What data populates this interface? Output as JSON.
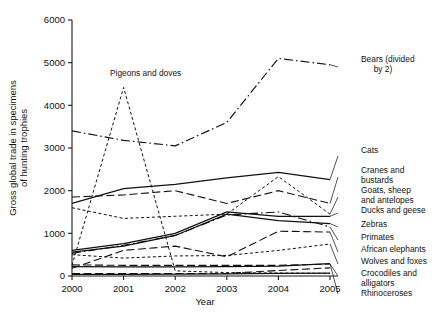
{
  "chart_data": {
    "type": "line",
    "title": "",
    "xlabel": "Year",
    "ylabel": "Gross global trade in specimens of hunting trophies",
    "x": [
      2000,
      2001,
      2002,
      2003,
      2004,
      2005
    ],
    "xticklabels": [
      "2000",
      "2001",
      "2002",
      "2003",
      "2004",
      "2005"
    ],
    "yticklabels": [
      "0",
      "1000",
      "2000",
      "3000",
      "4000",
      "5000",
      "6000"
    ],
    "yticks": [
      0,
      1000,
      2000,
      3000,
      4000,
      5000,
      6000
    ],
    "ylim": [
      0,
      6000
    ],
    "xlim": [
      2000,
      2005
    ],
    "grid": false,
    "legend_position": "right-of-axes-with-leader-lines",
    "series": [
      {
        "name": "Bears (divided by 2)",
        "label": "Bears (divided\nby 2)",
        "label_line1": "Bears (divided",
        "label_line2": "by 2)",
        "dash": "dashdot",
        "values": [
          3400,
          3180,
          3050,
          3600,
          5100,
          4950
        ]
      },
      {
        "name": "Pigeons and doves",
        "label": "Pigeons and doves",
        "dash": "dashed-fine",
        "values": [
          250,
          4420,
          120,
          80,
          70,
          60
        ]
      },
      {
        "name": "Cats",
        "label": "Cats",
        "dash": "solid",
        "values": [
          1700,
          2050,
          2150,
          2300,
          2430,
          2260
        ]
      },
      {
        "name": "Cranes and bustards",
        "label": "Cranes and\nbustards",
        "label_line1": "Cranes and",
        "label_line2": "bustards",
        "dash": "longdash",
        "values": [
          1850,
          1900,
          2000,
          1700,
          2000,
          1700
        ]
      },
      {
        "name": "Goats, sheep and antelopes",
        "label": "Goats, sheep\nand antelopes",
        "label_line1": "Goats, sheep",
        "label_line2": "and antelopes",
        "dash": "dashed-fine",
        "values": [
          1600,
          1350,
          1400,
          1450,
          2330,
          1450
        ]
      },
      {
        "name": "Ducks and geese",
        "label": "Ducks and geese",
        "dash": "solid",
        "values": [
          600,
          760,
          1000,
          1500,
          1400,
          1400
        ]
      },
      {
        "name": "Zebras",
        "label": "Zebras",
        "dash": "solid",
        "values": [
          560,
          700,
          950,
          1450,
          1300,
          1230
        ]
      },
      {
        "name": "Primates",
        "label": "Primates",
        "dash": "dashdot",
        "values": [
          530,
          720,
          950,
          1430,
          1500,
          1150
        ]
      },
      {
        "name": "African elephants",
        "label": "African elephants",
        "dash": "longdash",
        "values": [
          180,
          600,
          700,
          450,
          1050,
          1030
        ]
      },
      {
        "name": "Wolves and foxes",
        "label": "Wolves and foxes",
        "dash": "dashed-fine",
        "values": [
          500,
          420,
          470,
          480,
          600,
          750
        ]
      },
      {
        "name": "Crocodiles and alligators",
        "label": "Crocodiles and\nalligators",
        "label_line1": "Crocodiles and",
        "label_line2": "alligators",
        "dash": "longdash",
        "values": [
          260,
          250,
          250,
          250,
          250,
          280
        ]
      },
      {
        "name": "Rhinoceroses",
        "label": "Rhinoceroses",
        "dash": "solid",
        "values": [
          220,
          215,
          215,
          220,
          230,
          290
        ]
      },
      {
        "name": "unlabeled-low-series-a",
        "label": "",
        "dash": "longdash",
        "values": [
          60,
          55,
          60,
          60,
          130,
          190
        ]
      },
      {
        "name": "unlabeled-low-series-b",
        "label": "",
        "dash": "solid",
        "values": [
          40,
          40,
          45,
          50,
          60,
          70
        ]
      }
    ]
  },
  "axes": {
    "ylabel_line1": "Gross global trade in specimens",
    "ylabel_line2": "of hunting trophies"
  }
}
